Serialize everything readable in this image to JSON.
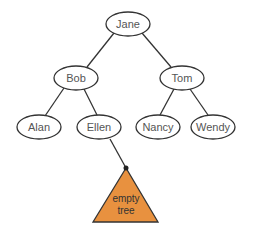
{
  "diagram": {
    "type": "binary-tree",
    "nodes": [
      {
        "id": "jane",
        "label": "Jane",
        "cx": 128,
        "cy": 24,
        "rx": 22,
        "ry": 12
      },
      {
        "id": "bob",
        "label": "Bob",
        "cx": 76,
        "cy": 78,
        "rx": 22,
        "ry": 12
      },
      {
        "id": "tom",
        "label": "Tom",
        "cx": 182,
        "cy": 78,
        "rx": 22,
        "ry": 12
      },
      {
        "id": "alan",
        "label": "Alan",
        "cx": 39,
        "cy": 127,
        "rx": 22,
        "ry": 12
      },
      {
        "id": "ellen",
        "label": "Ellen",
        "cx": 99,
        "cy": 127,
        "rx": 22,
        "ry": 12
      },
      {
        "id": "nancy",
        "label": "Nancy",
        "cx": 158,
        "cy": 127,
        "rx": 22,
        "ry": 12
      },
      {
        "id": "wendy",
        "label": "Wendy",
        "cx": 213,
        "cy": 127,
        "rx": 22,
        "ry": 12
      }
    ],
    "edges": [
      [
        "jane",
        "bob"
      ],
      [
        "jane",
        "tom"
      ],
      [
        "bob",
        "alan"
      ],
      [
        "bob",
        "ellen"
      ],
      [
        "tom",
        "nancy"
      ],
      [
        "tom",
        "wendy"
      ],
      [
        "ellen",
        "empty-tree"
      ]
    ],
    "empty_tree": {
      "label_line1": "empty",
      "label_line2": "tree",
      "fill": "#e8913f",
      "apex": [
        126,
        168
      ],
      "base_left": [
        93,
        222
      ],
      "base_right": [
        158,
        222
      ]
    }
  }
}
